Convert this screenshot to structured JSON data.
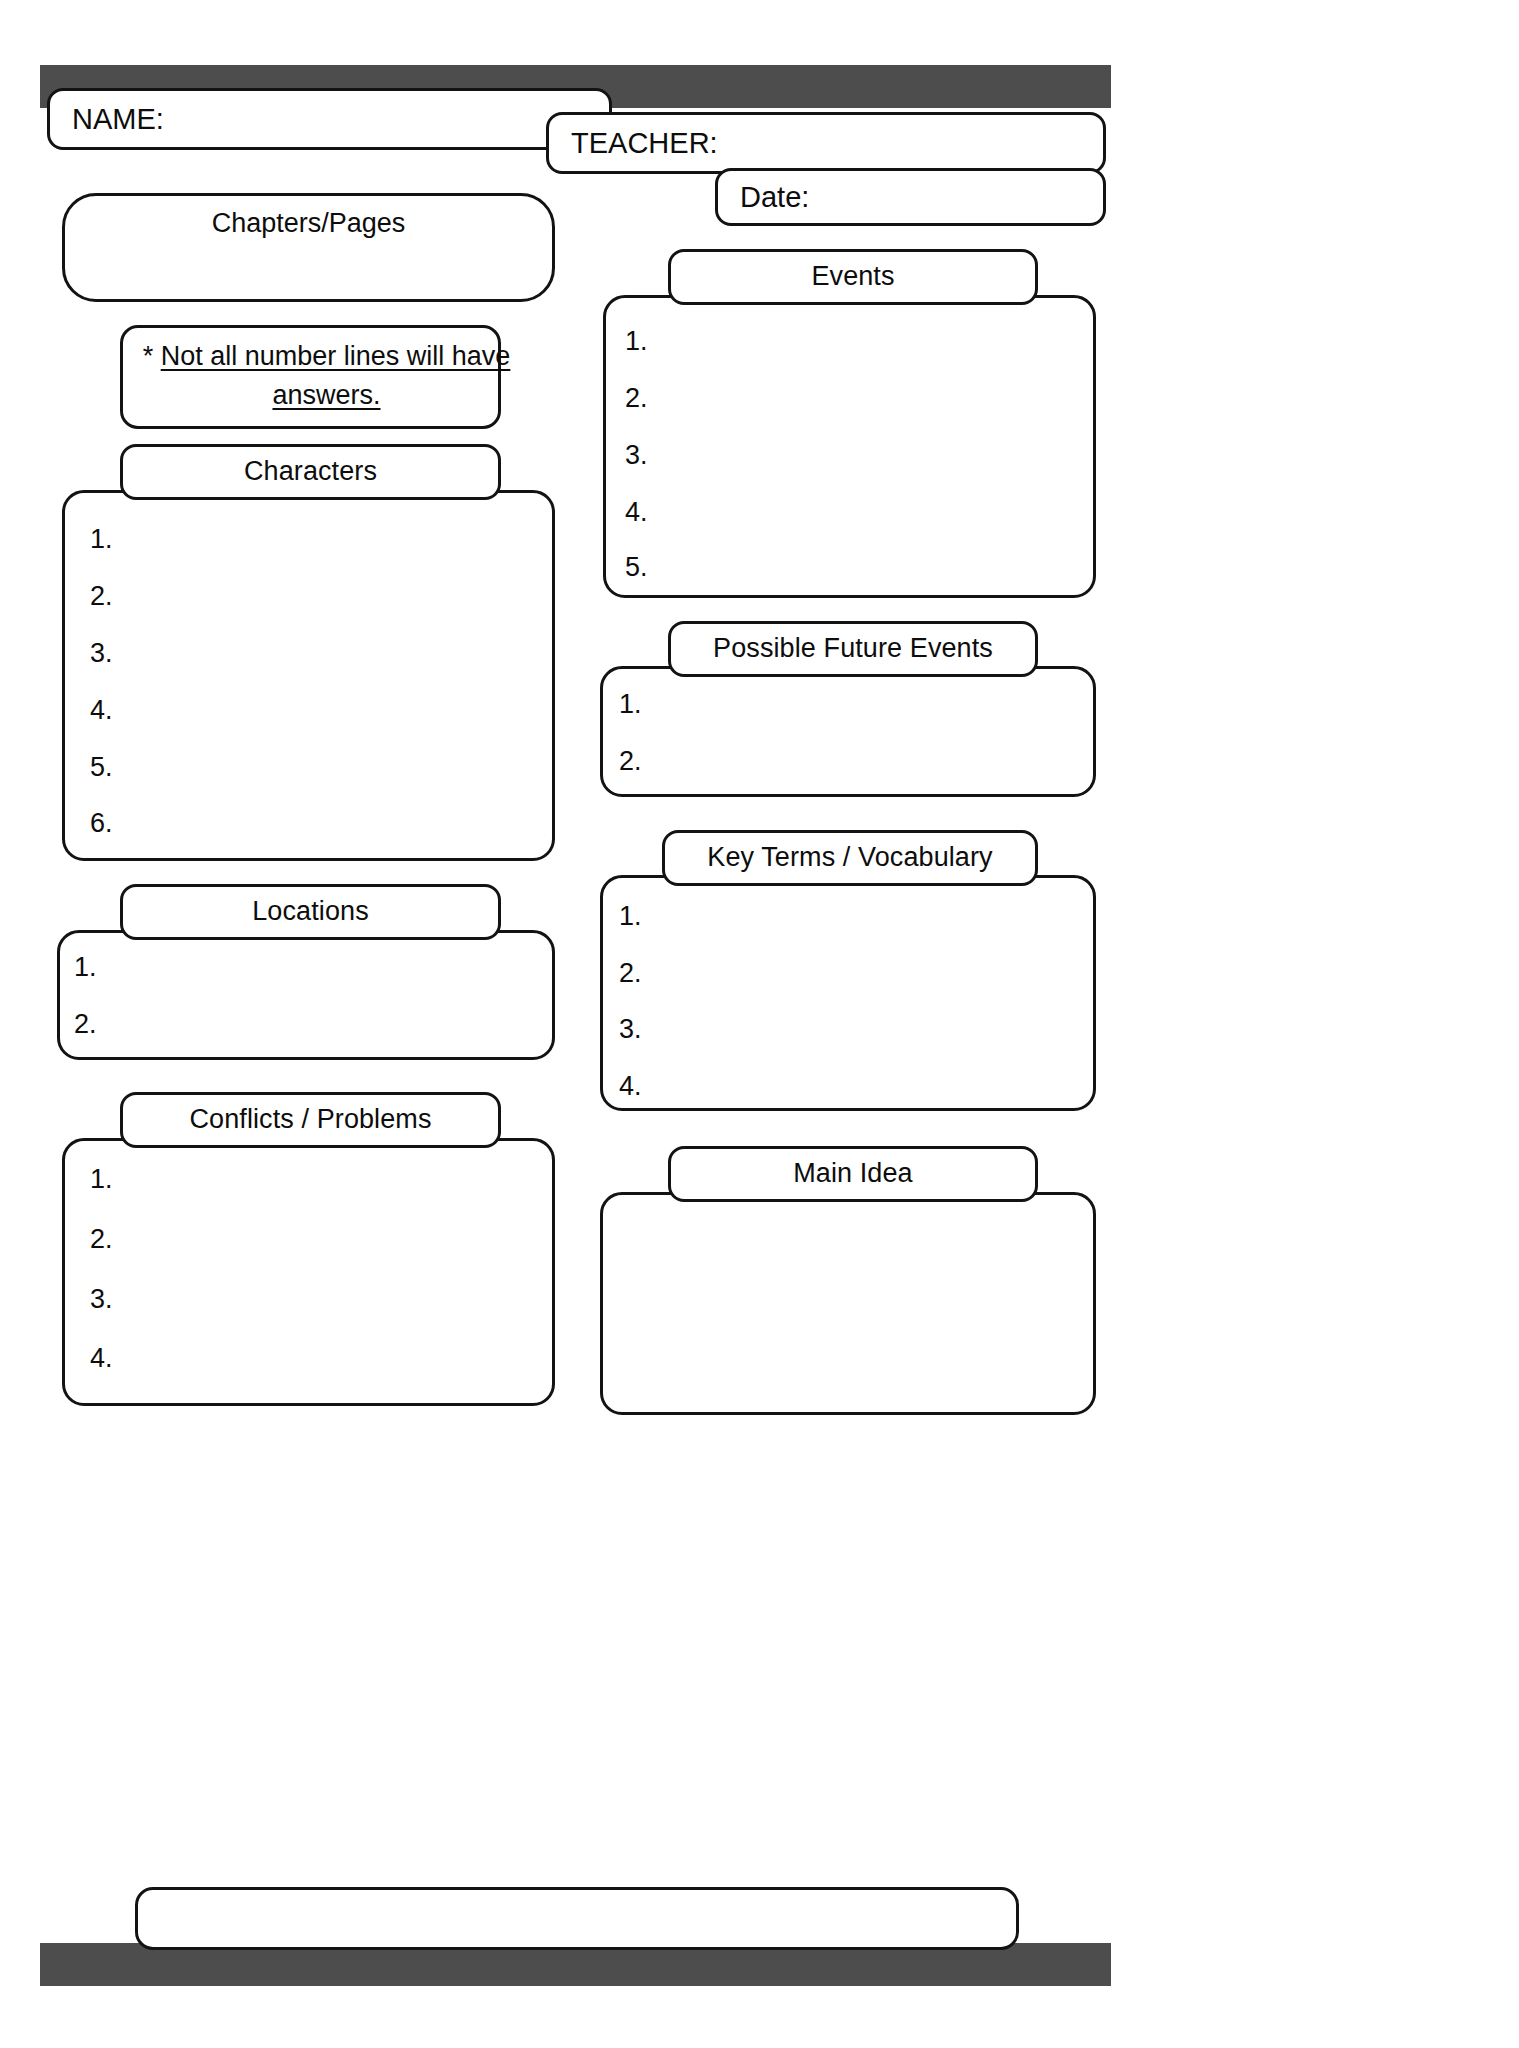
{
  "document": {
    "title": "Novel Study Graphic Organizer",
    "accent_dark": "#4d4d4d",
    "line_color": "#131313",
    "background": "#ffffff"
  },
  "header": {
    "name_label": "NAME:",
    "teacher_label": "TEACHER:",
    "date_label": "Date:"
  },
  "sections": {
    "chapters_pages": {
      "title": "Chapters/Pages"
    },
    "note": {
      "asterisk": "*",
      "text": "Not all number lines will have answers."
    },
    "characters": {
      "title": "Characters",
      "items": [
        "1.",
        "2.",
        "3.",
        "4.",
        "5.",
        "6."
      ]
    },
    "locations": {
      "title": "Locations",
      "items": [
        "1.",
        "2."
      ]
    },
    "conflicts_problems": {
      "title": "Conflicts / Problems",
      "items": [
        "1.",
        "2.",
        "3.",
        "4."
      ]
    },
    "events": {
      "title": "Events",
      "items": [
        "1.",
        "2.",
        "3.",
        "4.",
        "5."
      ]
    },
    "possible_future_events": {
      "title": "Possible Future Events",
      "items": [
        "1.",
        "2."
      ]
    },
    "key_terms_vocabulary": {
      "title": "Key Terms / Vocabulary",
      "items": [
        "1.",
        "2.",
        "3.",
        "4."
      ]
    },
    "main_idea": {
      "title": "Main Idea",
      "items": []
    }
  },
  "footer": {
    "notes_box": ""
  }
}
